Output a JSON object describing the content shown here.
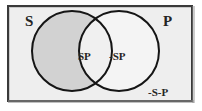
{
  "figure": {
    "type": "venn-2-set"
  },
  "labels": {
    "set_left": "S",
    "set_right": "P",
    "region_intersection": "SP",
    "region_right_only": "-SP",
    "region_outside": "-S-P"
  },
  "colors": {
    "frame_border": "#3a3a3a",
    "universe_fill": "#eeeeee",
    "circle_stroke": "#151515",
    "shaded_region_fill": "#d2d2d2",
    "unshaded_region_fill": "#f2f2f2",
    "text": "#242424"
  },
  "geometry": {
    "left_circle": {
      "cx": 65,
      "cy": 46,
      "r": 40
    },
    "right_circle": {
      "cx": 112,
      "cy": 46,
      "r": 40
    },
    "universe": {
      "x": 0,
      "y": 0,
      "width": 186,
      "height": 97
    }
  },
  "shading": {
    "left_only_shaded": true,
    "intersection_shaded": false,
    "right_only_shaded": false,
    "outside_shaded": false
  }
}
